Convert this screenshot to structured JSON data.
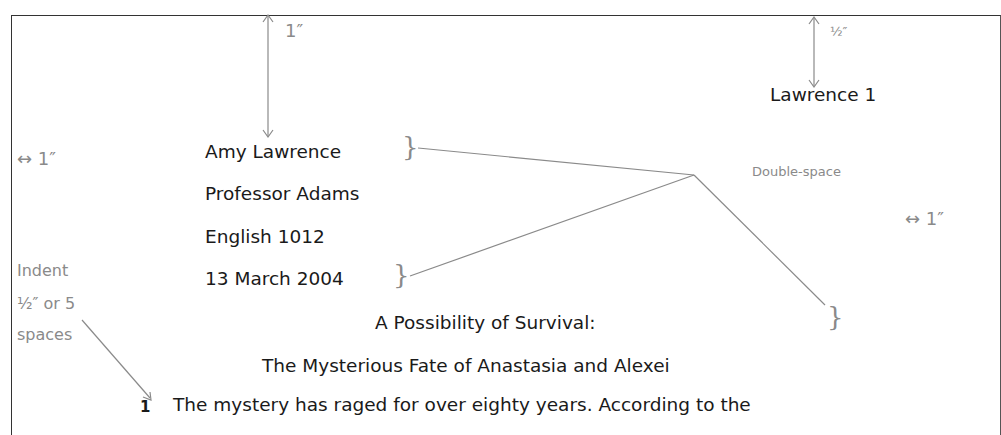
{
  "document": {
    "running_head": "Lawrence 1",
    "heading_lines": [
      "Amy Lawrence",
      "Professor Adams",
      "English 1012",
      "13 March 2004"
    ],
    "title_lines": [
      "A Possibility of Survival:",
      "The Mysterious Fate of Anastasia and Alexei"
    ],
    "first_line": "The mystery has raged for over eighty years. According to the",
    "paragraph_number": "1"
  },
  "annotations": {
    "top_margin": "1″",
    "header_margin": "½″",
    "left_margin": "↔ 1″",
    "right_margin": "↔ 1″",
    "double_space": "Double-space",
    "indent_lines": [
      "Indent",
      "½″ or 5",
      "spaces"
    ],
    "brace": "}"
  },
  "colors": {
    "text": "#1a1a1a",
    "annotation": "#8a8a8a",
    "border": "#333333"
  }
}
